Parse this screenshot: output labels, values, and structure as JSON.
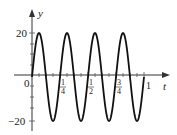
{
  "chart_data": {
    "type": "line",
    "title": "",
    "xlabel": "t",
    "ylabel": "y",
    "function": "y = 20 sin(8πt)",
    "xlim": [
      0,
      1
    ],
    "ylim": [
      -20,
      20
    ],
    "x_ticks": [
      "0",
      "1/4",
      "1/2",
      "3/4",
      "1"
    ],
    "x_tick_values": [
      0,
      0.25,
      0.5,
      0.75,
      1
    ],
    "y_ticks": [
      "20",
      "-20"
    ],
    "y_tick_values": [
      20,
      -20
    ],
    "grid": false,
    "legend": null,
    "series": [
      {
        "name": "y(t)",
        "x": [
          0,
          0.0625,
          0.125,
          0.1875,
          0.25,
          0.3125,
          0.375,
          0.4375,
          0.5,
          0.5625,
          0.625,
          0.6875,
          0.75,
          0.8125,
          0.875,
          0.9375,
          1
        ],
        "values": [
          0,
          20,
          0,
          -20,
          0,
          20,
          0,
          -20,
          0,
          20,
          0,
          -20,
          0,
          20,
          0,
          -20,
          0
        ]
      }
    ]
  },
  "axes": {
    "x_label": "t",
    "y_label": "y",
    "origin_label": "0",
    "y_top_label": "20",
    "y_bottom_label": "−20",
    "x_tick_labels": [
      {
        "num": "1",
        "den": "4"
      },
      {
        "num": "1",
        "den": "2"
      },
      {
        "num": "3",
        "den": "4"
      }
    ],
    "x_end_label": "1"
  },
  "colors": {
    "curve": "#111111",
    "axis": "#333333"
  }
}
